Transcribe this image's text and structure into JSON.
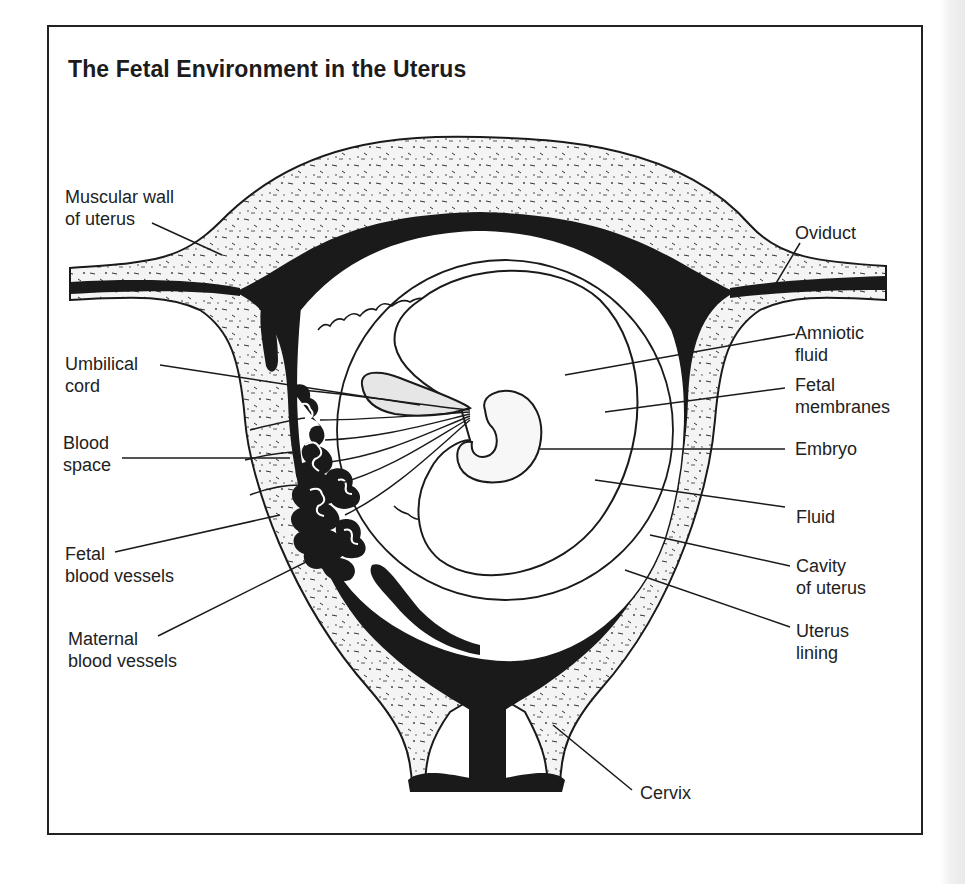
{
  "figure": {
    "title": "The Fetal Environment in the Uterus",
    "colors": {
      "ink": "#1a1a1a",
      "paper": "#ffffff",
      "tissue_speckle": "#2a2a2a"
    },
    "labels_left": [
      {
        "id": "muscular-wall",
        "line1": "Muscular wall",
        "line2": "of uterus"
      },
      {
        "id": "umbilical-cord",
        "line1": "Umbilical",
        "line2": "cord"
      },
      {
        "id": "blood-space",
        "line1": "Blood",
        "line2": "space"
      },
      {
        "id": "fetal-blood-vessels",
        "line1": "Fetal",
        "line2": "blood vessels"
      },
      {
        "id": "maternal-blood-vessels",
        "line1": "Maternal",
        "line2": "blood vessels"
      }
    ],
    "labels_right": [
      {
        "id": "oviduct",
        "line1": "Oviduct",
        "line2": ""
      },
      {
        "id": "amniotic-fluid",
        "line1": "Amniotic",
        "line2": "fluid"
      },
      {
        "id": "fetal-membranes",
        "line1": "Fetal",
        "line2": "membranes"
      },
      {
        "id": "embryo",
        "line1": "Embryo",
        "line2": ""
      },
      {
        "id": "fluid",
        "line1": "Fluid",
        "line2": ""
      },
      {
        "id": "cavity-of-uterus",
        "line1": "Cavity",
        "line2": "of uterus"
      },
      {
        "id": "uterus-lining",
        "line1": "Uterus",
        "line2": "lining"
      },
      {
        "id": "cervix",
        "line1": "Cervix",
        "line2": ""
      }
    ]
  }
}
